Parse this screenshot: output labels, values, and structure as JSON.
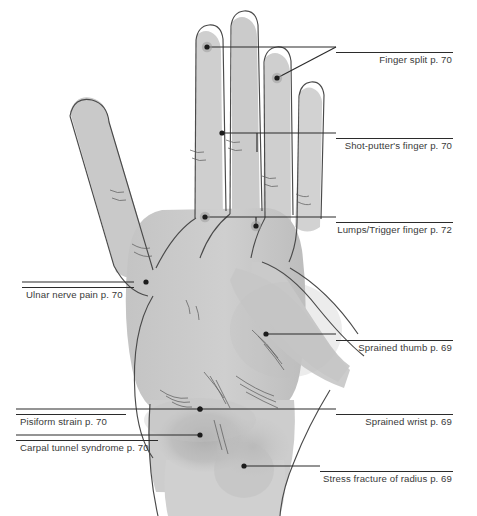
{
  "figure": {
    "background_color": "#ffffff",
    "line_color": "#2b2b2b",
    "text_color": "#3a3a3a",
    "hand_fill": "#c9c9c9",
    "highlight_fill": "#b4b4b4"
  },
  "callouts": [
    {
      "id": "finger-split",
      "label": "Finger split p. 70",
      "page": "p. 70",
      "side": "right",
      "rule": {
        "x": 336,
        "y": 52,
        "width": 117
      },
      "text_x": 453,
      "text_y": 54,
      "leader": {
        "from_x": 207,
        "from_y": 47,
        "to_x": 336,
        "to_y": 47
      },
      "marker": {
        "x": 207,
        "y": 47,
        "halo": true
      },
      "diagonal": {
        "x1": 336,
        "y1": 47,
        "x2": 277,
        "y2": 78
      },
      "marker2": {
        "x": 277,
        "y": 78,
        "halo": true
      }
    },
    {
      "id": "shot-putters-finger",
      "label": "Shot-putter's finger p. 70",
      "page": "p. 70",
      "side": "right",
      "rule": {
        "x": 336,
        "y": 138,
        "width": 117
      },
      "text_x": 453,
      "text_y": 140,
      "leader": {
        "from_x": 222,
        "from_y": 133,
        "to_x": 336,
        "to_y": 133
      },
      "marker": {
        "x": 222,
        "y": 133,
        "halo": false
      },
      "stub": {
        "x": 257,
        "y1": 133,
        "y2": 152
      }
    },
    {
      "id": "lumps-trigger-finger",
      "label": "Lumps/Trigger finger p. 72",
      "page": "p. 72",
      "side": "right",
      "rule": {
        "x": 336,
        "y": 222,
        "width": 117
      },
      "text_x": 453,
      "text_y": 224,
      "leader": {
        "from_x": 205,
        "from_y": 217,
        "to_x": 336,
        "to_y": 217
      },
      "marker": {
        "x": 205,
        "y": 217,
        "halo": true
      },
      "stub": {
        "x": 256,
        "y1": 217,
        "y2": 226
      },
      "marker2": {
        "x": 256,
        "y": 226,
        "halo": true
      }
    },
    {
      "id": "sprained-thumb",
      "label": "Sprained thumb p. 69",
      "page": "p. 69",
      "side": "right",
      "rule": {
        "x": 336,
        "y": 340,
        "width": 117
      },
      "text_x": 453,
      "text_y": 342,
      "leader": {
        "from_x": 266,
        "from_y": 334,
        "to_x": 336,
        "to_y": 334
      },
      "marker": {
        "x": 266,
        "y": 334,
        "halo": false
      }
    },
    {
      "id": "sprained-wrist",
      "label": "Sprained wrist p. 69",
      "page": "p. 69",
      "side": "right",
      "rule": {
        "x": 336,
        "y": 414,
        "width": 117
      },
      "text_x": 453,
      "text_y": 416,
      "leader": {
        "from_x": 200,
        "from_y": 409,
        "to_x": 336,
        "to_y": 409
      },
      "marker": {
        "x": 200,
        "y": 409,
        "halo": false
      }
    },
    {
      "id": "stress-fracture-of-radius",
      "label": "Stress fracture of radius p. 69",
      "page": "p. 69",
      "side": "right",
      "rule": {
        "x": 320,
        "y": 471,
        "width": 133
      },
      "text_x": 453,
      "text_y": 473,
      "leader": {
        "from_x": 244,
        "from_y": 466,
        "to_x": 320,
        "to_y": 466
      },
      "marker": {
        "x": 244,
        "y": 466,
        "halo": false
      }
    },
    {
      "id": "ulnar-nerve-pain",
      "label": "Ulnar nerve pain p. 70",
      "page": "p. 70",
      "side": "left",
      "rule": {
        "x": 22,
        "y": 287,
        "width": 112
      },
      "text_x": 22,
      "text_y": 289,
      "leader": {
        "from_x": 134,
        "from_y": 282,
        "to_x": 22,
        "to_y": 282
      },
      "marker": {
        "x": 146,
        "y": 282,
        "halo": false
      }
    },
    {
      "id": "pisiform-strain",
      "label": "Pisiform strain p. 70",
      "page": "p. 70",
      "side": "left",
      "rule": {
        "x": 16,
        "y": 414,
        "width": 110
      },
      "text_x": 16,
      "text_y": 416,
      "leader": {
        "from_x": 200,
        "from_y": 409,
        "to_x": 16,
        "to_y": 409
      },
      "marker": {
        "x": 200,
        "y": 409,
        "halo": false
      }
    },
    {
      "id": "carpal-tunnel-syndrome",
      "label": "Carpal tunnel syndrome p. 70",
      "page": "p. 70",
      "side": "left",
      "rule": {
        "x": 16,
        "y": 440,
        "width": 142
      },
      "text_x": 16,
      "text_y": 442,
      "leader": {
        "from_x": 200,
        "from_y": 435,
        "to_x": 16,
        "to_y": 435
      },
      "marker": {
        "x": 200,
        "y": 435,
        "halo": false
      }
    }
  ]
}
